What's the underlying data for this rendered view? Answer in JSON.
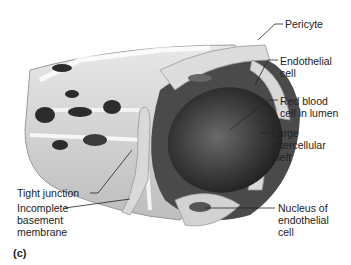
{
  "figure": {
    "panel_label": "(c)",
    "labels": {
      "pericyte": "Pericyte",
      "endothelial_cell": "Endothelial\ncell",
      "red_blood_cell": "Red blood\ncell in lumen",
      "intercellular_cleft": "Large\nintercellular\ncleft",
      "tight_junction": "Tight junction",
      "basement_membrane": "Incomplete\nbasement\nmembrane",
      "nucleus": "Nucleus of\nendothelial\ncell"
    }
  }
}
